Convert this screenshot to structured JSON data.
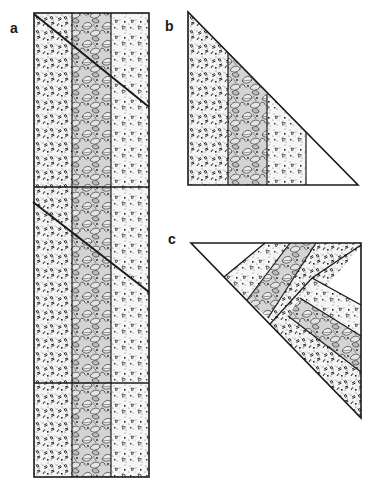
{
  "figure": {
    "panels": [
      {
        "id": "a",
        "label": "a",
        "caption": "Three strips sewn into a long band, with 45-degree cutting lines and crosswise seams"
      },
      {
        "id": "b",
        "label": "b",
        "caption": "Right triangle cut from the strip band"
      },
      {
        "id": "c",
        "label": "c",
        "caption": "Triangle pieces rejoined so the strips form a chevron"
      }
    ],
    "fabrics": [
      {
        "name": "dash-print",
        "description": "light speckled fabric with small dash marks"
      },
      {
        "name": "leaf-print",
        "description": "dense dark leaf print"
      },
      {
        "name": "triangle-print",
        "description": "light speckled fabric with small triangle outlines"
      }
    ],
    "colors": {
      "ink": "#1a1a1a",
      "paper": "#ffffff"
    }
  }
}
